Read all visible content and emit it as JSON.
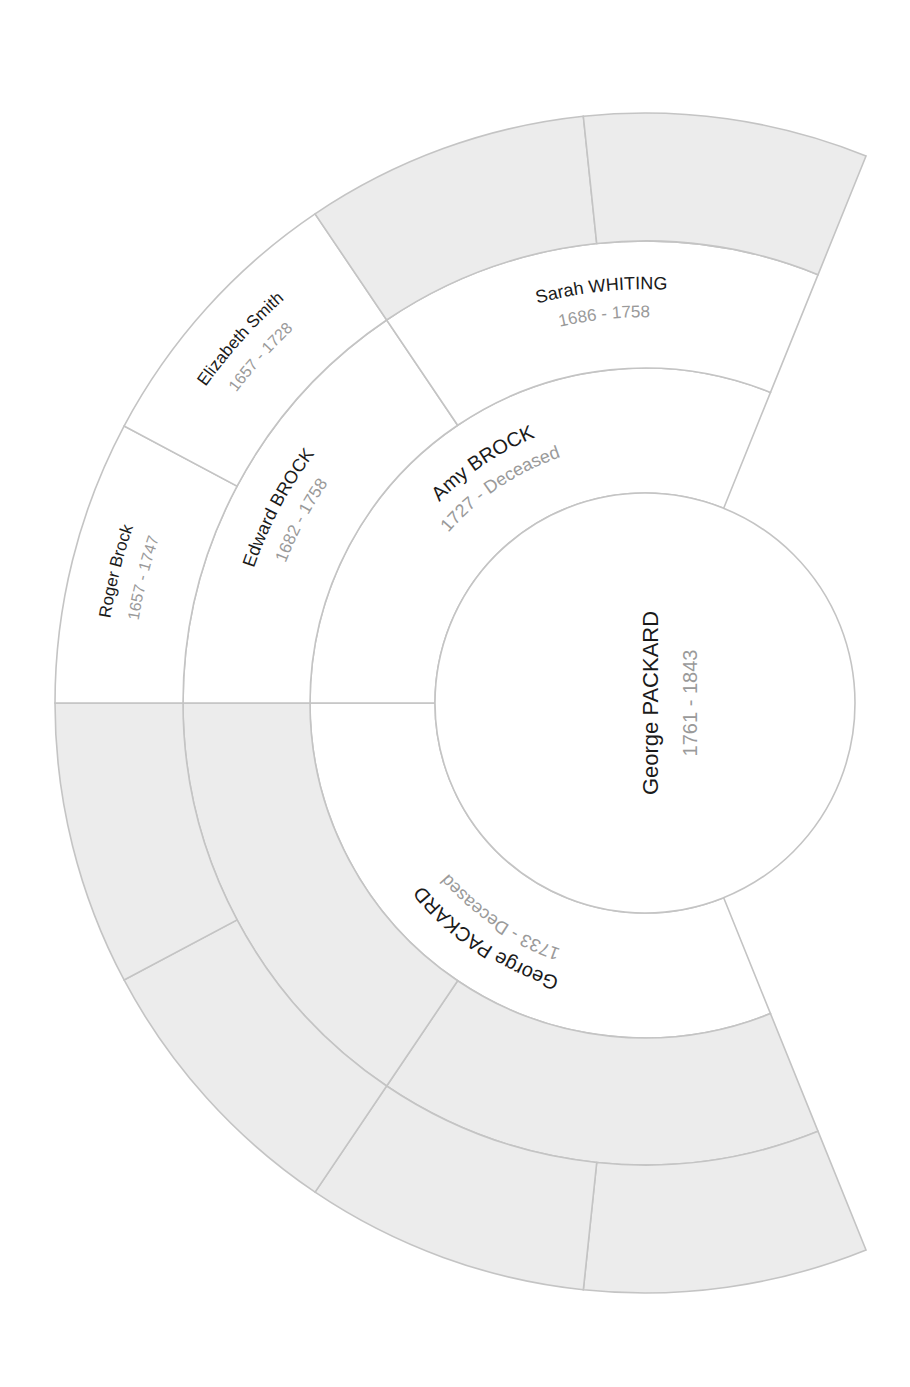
{
  "chart": {
    "type": "ancestor-fan-chart",
    "center": {
      "x": 645,
      "y": 703
    },
    "start_angle_deg": 68,
    "end_angle_deg": 292,
    "radii": [
      210,
      335,
      462,
      590
    ],
    "colors": {
      "stroke": "#c4c4c4",
      "empty_fill": "#ececec",
      "filled_fill": "#ffffff",
      "name": "#1a1a1a",
      "dates": "#9a9a9a"
    }
  },
  "root": {
    "name": "George PACKARD",
    "dates": "1761 - 1843"
  },
  "generations": [
    {
      "level": 1,
      "segments": [
        {
          "id": "gen1-0",
          "name": "George PACKARD",
          "dates": "1733 - Deceased",
          "a0": 180,
          "a1": 292,
          "empty": false
        },
        {
          "id": "gen1-1",
          "name": "Amy BROCK",
          "dates": "1727 - Deceased",
          "a0": 68,
          "a1": 180,
          "empty": false
        }
      ]
    },
    {
      "level": 2,
      "segments": [
        {
          "id": "gen2-0",
          "name": "",
          "dates": "",
          "a0": 236,
          "a1": 292,
          "empty": true
        },
        {
          "id": "gen2-1",
          "name": "",
          "dates": "",
          "a0": 180,
          "a1": 236,
          "empty": true
        },
        {
          "id": "gen2-2",
          "name": "Edward BROCK",
          "dates": "1682 - 1758",
          "a0": 124,
          "a1": 180,
          "empty": false
        },
        {
          "id": "gen2-3",
          "name": "Sarah WHITING",
          "dates": "1686 - 1758",
          "a0": 68,
          "a1": 124,
          "empty": false
        }
      ]
    },
    {
      "level": 3,
      "segments": [
        {
          "id": "gen3-0",
          "name": "",
          "dates": "",
          "a0": 264,
          "a1": 292,
          "empty": true
        },
        {
          "id": "gen3-1",
          "name": "",
          "dates": "",
          "a0": 236,
          "a1": 264,
          "empty": true
        },
        {
          "id": "gen3-2",
          "name": "",
          "dates": "",
          "a0": 208,
          "a1": 236,
          "empty": true
        },
        {
          "id": "gen3-3",
          "name": "",
          "dates": "",
          "a0": 180,
          "a1": 208,
          "empty": true
        },
        {
          "id": "gen3-4",
          "name": "Roger Brock",
          "dates": "1657 - 1747",
          "a0": 152,
          "a1": 180,
          "empty": false
        },
        {
          "id": "gen3-5",
          "name": "Elizabeth Smith",
          "dates": "1657 - 1728",
          "a0": 124,
          "a1": 152,
          "empty": false
        },
        {
          "id": "gen3-6",
          "name": "",
          "dates": "",
          "a0": 96,
          "a1": 124,
          "empty": true
        },
        {
          "id": "gen3-7",
          "name": "",
          "dates": "",
          "a0": 68,
          "a1": 96,
          "empty": true
        }
      ]
    }
  ],
  "chart_data": {
    "type": "fan-chart",
    "title": "",
    "root": {
      "name": "George PACKARD",
      "dates": "1761 - 1843"
    },
    "ancestors": [
      {
        "generation": 1,
        "relation": "father",
        "name": "George PACKARD",
        "dates": "1733 - Deceased"
      },
      {
        "generation": 1,
        "relation": "mother",
        "name": "Amy BROCK",
        "dates": "1727 - Deceased"
      },
      {
        "generation": 2,
        "relation": "maternal grandfather",
        "name": "Edward BROCK",
        "dates": "1682 - 1758"
      },
      {
        "generation": 2,
        "relation": "maternal grandmother",
        "name": "Sarah WHITING",
        "dates": "1686 - 1758"
      },
      {
        "generation": 3,
        "relation": "maternal grandfather's father",
        "name": "Roger Brock",
        "dates": "1657 - 1747"
      },
      {
        "generation": 3,
        "relation": "maternal grandfather's mother",
        "name": "Elizabeth Smith",
        "dates": "1657 - 1728"
      }
    ],
    "empty_slots": 10
  }
}
